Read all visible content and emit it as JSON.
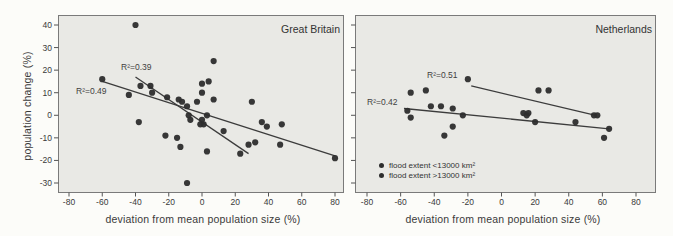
{
  "page": {
    "background": "#fcfcf9"
  },
  "figure": {
    "y_axis_title": "population change (%)",
    "ink_color": "#2d2d2d",
    "line_color": "#3c3c3c",
    "panel_bg": "#e9e9e5",
    "panel_border": "#7a7a7a",
    "tick_color": "#555555",
    "text_color": "#3a3a3a"
  },
  "chart_data": [
    {
      "type": "scatter",
      "title": "Great Britain",
      "xlabel": "deviation from mean population size (%)",
      "ylabel": "population change (%)",
      "xlim": [
        -80,
        80
      ],
      "ylim": [
        -30,
        40
      ],
      "xticks": [
        -80,
        -60,
        -40,
        -20,
        0,
        20,
        40,
        60,
        80
      ],
      "yticks": [
        40,
        30,
        20,
        10,
        0,
        -10,
        -20,
        -30
      ],
      "grid": false,
      "legend_position": "none",
      "points": [
        [
          -40,
          40
        ],
        [
          7,
          24
        ],
        [
          -60,
          16
        ],
        [
          -44,
          9
        ],
        [
          -37,
          13
        ],
        [
          -31,
          13
        ],
        [
          -30,
          10
        ],
        [
          -21,
          8
        ],
        [
          -14,
          7
        ],
        [
          -12,
          6
        ],
        [
          -9,
          4
        ],
        [
          -3,
          6
        ],
        [
          0,
          14
        ],
        [
          4,
          15
        ],
        [
          0,
          10
        ],
        [
          7,
          7
        ],
        [
          30,
          6
        ],
        [
          -8,
          0
        ],
        [
          -7,
          -2
        ],
        [
          -1,
          -4
        ],
        [
          0,
          -2
        ],
        [
          1,
          -4
        ],
        [
          3,
          0
        ],
        [
          -38,
          -3
        ],
        [
          -22,
          -9
        ],
        [
          -15,
          -10
        ],
        [
          -13,
          -14
        ],
        [
          13,
          -7
        ],
        [
          3,
          -16
        ],
        [
          -9,
          -30
        ],
        [
          36,
          -3
        ],
        [
          39,
          -5
        ],
        [
          48,
          -4
        ],
        [
          47,
          -13
        ],
        [
          28,
          -13
        ],
        [
          32,
          -12
        ],
        [
          23,
          -17
        ],
        [
          80,
          -19
        ]
      ],
      "regression_lines": [
        {
          "label": "R²=0.39",
          "r_squared": 0.39,
          "from": [
            -40,
            17
          ],
          "to": [
            28,
            -17
          ]
        },
        {
          "label": "R²=0.49",
          "r_squared": 0.49,
          "from": [
            -60,
            15
          ],
          "to": [
            80,
            -18
          ]
        }
      ]
    },
    {
      "type": "scatter",
      "title": "Netherlands",
      "xlabel": "deviation from mean population size (%)",
      "ylabel": "",
      "xlim": [
        -80,
        80
      ],
      "ylim": [
        -30,
        40
      ],
      "xticks": [
        -80,
        -60,
        -40,
        -20,
        0,
        20,
        40,
        60,
        80
      ],
      "yticks": [
        40,
        30,
        20,
        10,
        0,
        -10,
        -20,
        -30
      ],
      "grid": false,
      "legend_position": "bottom-left",
      "points": [
        [
          -54,
          10
        ],
        [
          -45,
          11
        ],
        [
          -20,
          16
        ],
        [
          22,
          11
        ],
        [
          28,
          11
        ],
        [
          -56,
          2
        ],
        [
          -54,
          -1
        ],
        [
          -42,
          4
        ],
        [
          -36,
          4
        ],
        [
          -29,
          3
        ],
        [
          -23,
          0
        ],
        [
          -29,
          -5
        ],
        [
          -34,
          -9
        ],
        [
          13,
          1
        ],
        [
          15,
          0
        ],
        [
          16,
          1
        ],
        [
          20,
          -3
        ],
        [
          44,
          -3
        ],
        [
          55,
          0
        ],
        [
          57,
          0
        ],
        [
          64,
          -6
        ],
        [
          61,
          -10
        ]
      ],
      "regression_lines": [
        {
          "label": "R²=0.51",
          "r_squared": 0.51,
          "from": [
            -18,
            13
          ],
          "to": [
            56,
            0
          ]
        },
        {
          "label": "R²=0.42",
          "r_squared": 0.42,
          "from": [
            -58,
            3
          ],
          "to": [
            64,
            -6
          ]
        }
      ],
      "legend": {
        "items": [
          {
            "label": "flood extent <13000 km²",
            "marker": "dot"
          },
          {
            "label": "flood extent >13000 km²",
            "marker": "dot"
          }
        ]
      }
    }
  ]
}
